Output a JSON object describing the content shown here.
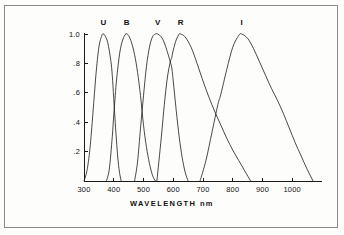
{
  "figure": {
    "background_color": "#fdfdfc",
    "border_color": "#8a8a8a",
    "line_color": "#1a1a1a"
  },
  "axis": {
    "x_title": "WAVELENGTH   nm",
    "x_unit": "nm"
  },
  "chart_data": {
    "type": "line",
    "title": "",
    "subtitle": "",
    "xlabel": "WAVELENGTH   nm",
    "ylabel": "",
    "xlim": [
      300,
      1100
    ],
    "ylim": [
      0,
      1.05
    ],
    "grid": false,
    "legend": "inline-labels-above-peaks",
    "xticks": [
      300,
      400,
      500,
      600,
      700,
      800,
      900,
      1000
    ],
    "xticklabels": [
      "300",
      "400",
      "500",
      "600",
      "700",
      "800",
      "900",
      "1000"
    ],
    "yticks": [
      0.2,
      0.4,
      0.6,
      0.8,
      1.0
    ],
    "yticklabels": [
      ".2",
      ".4",
      ".6",
      ".8",
      "1.0"
    ],
    "annotations": [
      {
        "text": "U",
        "x": 365,
        "y": 1.0
      },
      {
        "text": "B",
        "x": 443,
        "y": 1.0
      },
      {
        "text": "V",
        "x": 548,
        "y": 1.0
      },
      {
        "text": "R",
        "x": 625,
        "y": 1.0
      },
      {
        "text": "I",
        "x": 830,
        "y": 1.0
      }
    ],
    "series": [
      {
        "name": "U",
        "peak_wavelength": 365,
        "peak_value": 1.0,
        "x": [
          300,
          310,
          320,
          330,
          340,
          350,
          360,
          365,
          370,
          380,
          390,
          395,
          400,
          405,
          410,
          415,
          420,
          425
        ],
        "values": [
          0.0,
          0.07,
          0.22,
          0.46,
          0.72,
          0.91,
          0.99,
          1.0,
          0.99,
          0.94,
          0.82,
          0.72,
          0.56,
          0.4,
          0.25,
          0.13,
          0.05,
          0.0
        ]
      },
      {
        "name": "B",
        "peak_wavelength": 443,
        "peak_value": 1.0,
        "x": [
          375,
          385,
          395,
          400,
          405,
          410,
          420,
          430,
          440,
          443,
          450,
          460,
          470,
          480,
          490,
          500,
          510,
          520,
          530,
          540
        ],
        "values": [
          0.0,
          0.08,
          0.3,
          0.45,
          0.58,
          0.7,
          0.87,
          0.96,
          1.0,
          1.0,
          0.99,
          0.94,
          0.86,
          0.74,
          0.58,
          0.38,
          0.23,
          0.12,
          0.04,
          0.0
        ]
      },
      {
        "name": "V",
        "peak_wavelength": 548,
        "peak_value": 1.0,
        "x": [
          470,
          480,
          490,
          500,
          510,
          520,
          530,
          540,
          548,
          560,
          570,
          580,
          590,
          595,
          600,
          610,
          620,
          630,
          640,
          650
        ],
        "values": [
          0.0,
          0.13,
          0.36,
          0.58,
          0.78,
          0.91,
          0.98,
          1.0,
          1.0,
          0.98,
          0.94,
          0.88,
          0.81,
          0.77,
          0.68,
          0.48,
          0.3,
          0.16,
          0.06,
          0.0
        ]
      },
      {
        "name": "R",
        "peak_wavelength": 625,
        "peak_value": 1.0,
        "x": [
          545,
          560,
          570,
          580,
          590,
          595,
          600,
          610,
          620,
          625,
          640,
          660,
          680,
          700,
          720,
          740,
          760,
          780,
          800,
          820,
          840,
          860
        ],
        "values": [
          0.0,
          0.3,
          0.52,
          0.7,
          0.81,
          0.84,
          0.89,
          0.96,
          1.0,
          1.0,
          0.98,
          0.91,
          0.8,
          0.68,
          0.57,
          0.47,
          0.38,
          0.29,
          0.21,
          0.14,
          0.07,
          0.0
        ]
      },
      {
        "name": "I",
        "peak_wavelength": 830,
        "peak_value": 1.0,
        "x": [
          690,
          710,
          730,
          750,
          760,
          780,
          800,
          820,
          830,
          850,
          870,
          890,
          910,
          930,
          950,
          970,
          990,
          1010,
          1030,
          1050,
          1070
        ],
        "values": [
          0.0,
          0.14,
          0.33,
          0.52,
          0.59,
          0.76,
          0.91,
          0.99,
          1.0,
          0.97,
          0.9,
          0.81,
          0.72,
          0.63,
          0.55,
          0.46,
          0.36,
          0.26,
          0.17,
          0.08,
          0.0
        ]
      }
    ]
  }
}
